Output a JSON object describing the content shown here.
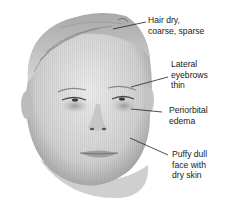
{
  "figure": {
    "colors": {
      "skin_light": "#e4e4e4",
      "skin_mid": "#bdbdbd",
      "shadow": "#8a8a8a",
      "line": "#222222",
      "text": "#1a1a1a"
    },
    "annotations": [
      {
        "id": "hair",
        "lines": [
          "Hair dry,",
          "coarse, sparse"
        ]
      },
      {
        "id": "eyebrows",
        "lines": [
          "Lateral",
          "eyebrows",
          "thin"
        ]
      },
      {
        "id": "periorbital",
        "lines": [
          "Periorbital",
          "edema"
        ]
      },
      {
        "id": "face",
        "lines": [
          "Puffy dull",
          "face with",
          "dry skin"
        ]
      }
    ]
  }
}
